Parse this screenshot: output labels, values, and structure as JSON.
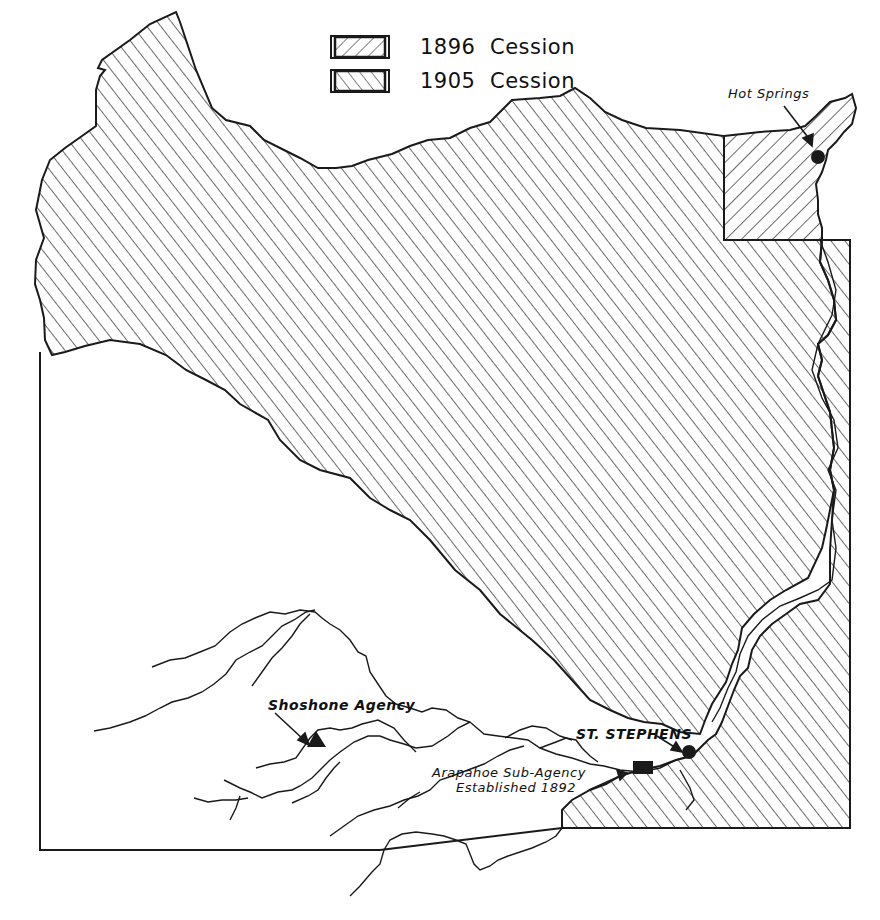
{
  "legend": {
    "items": [
      {
        "year": "1896",
        "label": "Cession",
        "pattern": "hatch-backslash"
      },
      {
        "year": "1905",
        "label": "Cession",
        "pattern": "hatch-forwardslash"
      }
    ]
  },
  "labels": {
    "hot_springs": "Hot Springs",
    "shoshone_agency": "Shoshone Agency",
    "st_stephens": "ST. STEPHENS",
    "arapahoe_line1": "Arapahoe Sub-Agency",
    "arapahoe_line2": "Established 1892"
  },
  "markers": [
    {
      "name": "Hot Springs",
      "symbol": "circle-filled",
      "x": 818,
      "y": 157
    },
    {
      "name": "St. Stephens",
      "symbol": "circle-filled",
      "x": 689,
      "y": 752
    },
    {
      "name": "Shoshone Agency",
      "symbol": "triangle-filled",
      "x": 316,
      "y": 738
    },
    {
      "name": "Arapahoe Sub-Agency",
      "symbol": "rectangle-filled",
      "x": 643,
      "y": 767
    }
  ],
  "colors": {
    "ink": "#1a1a1a",
    "paper": "#ffffff"
  }
}
